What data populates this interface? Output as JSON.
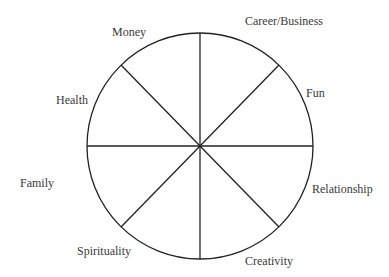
{
  "diagram": {
    "type": "wheel-of-life",
    "center": [
      200,
      146
    ],
    "radius": 113,
    "stroke_color": "#222222",
    "segments": 8,
    "labels": {
      "career": "Career/Business",
      "money": "Money",
      "fun": "Fun",
      "health": "Health",
      "family": "Family",
      "relationship": "Relationship",
      "spirituality": "Spirituality",
      "creativity": "Creativity"
    }
  }
}
